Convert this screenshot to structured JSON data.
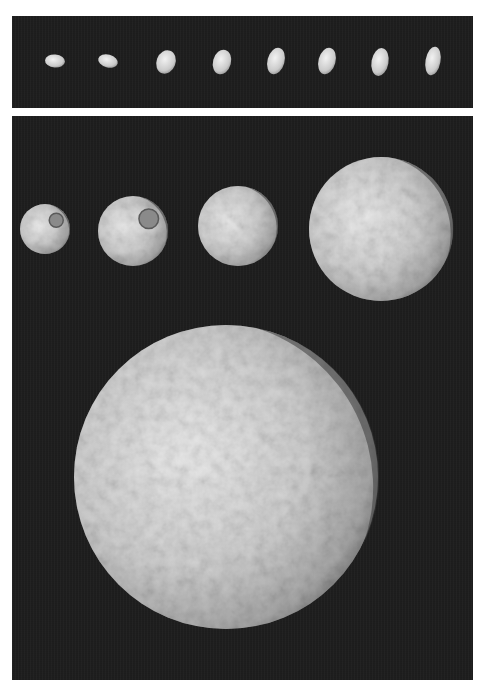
{
  "figure": {
    "top_panel": {
      "description": "Rotation sequence of a small irregular moon",
      "frames": [
        {
          "cx": 55,
          "cy": 61,
          "w": 20,
          "h": 13,
          "rot": 5
        },
        {
          "cx": 108,
          "cy": 61,
          "w": 20,
          "h": 13,
          "rot": 15
        },
        {
          "cx": 166,
          "cy": 62,
          "w": 19,
          "h": 24,
          "rot": 20
        },
        {
          "cx": 222,
          "cy": 62,
          "w": 18,
          "h": 25,
          "rot": 15
        },
        {
          "cx": 276,
          "cy": 61,
          "w": 17,
          "h": 27,
          "rot": 15
        },
        {
          "cx": 327,
          "cy": 61,
          "w": 17,
          "h": 27,
          "rot": 15
        },
        {
          "cx": 380,
          "cy": 62,
          "w": 17,
          "h": 28,
          "rot": 10
        },
        {
          "cx": 433,
          "cy": 61,
          "w": 15,
          "h": 29,
          "rot": 10
        }
      ]
    },
    "bottom_panel": {
      "description": "Approach sequence of a heavily cratered moon",
      "moons": [
        {
          "cx": 45,
          "cy": 229,
          "r": 25
        },
        {
          "cx": 133,
          "cy": 231,
          "r": 35
        },
        {
          "cx": 238,
          "cy": 226,
          "r": 40
        },
        {
          "cx": 381,
          "cy": 229,
          "r": 72
        },
        {
          "cx": 226,
          "cy": 477,
          "r": 152
        }
      ]
    },
    "colors": {
      "background": "#ffffff",
      "space": "#1e1e1e",
      "surface_light": "#e6e6e6",
      "surface_mid": "#b8b8b8",
      "surface_shadow": "#555555"
    }
  }
}
